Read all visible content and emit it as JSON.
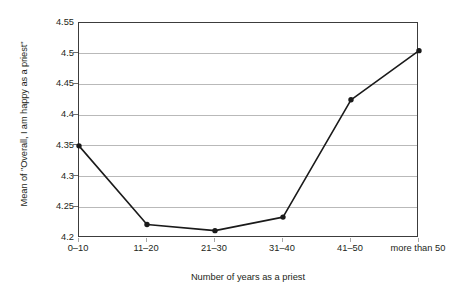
{
  "chart_data": {
    "type": "line",
    "title": "",
    "subtitle": "",
    "xlabel": "Number of years as a priest",
    "ylabel": "Mean of \"Overall, I am happy as a priest\"",
    "categories": [
      "0–10",
      "11–20",
      "21–30",
      "31–40",
      "41–50",
      "more than 50"
    ],
    "values": [
      4.35,
      4.222,
      4.212,
      4.234,
      4.425,
      4.505
    ],
    "series": [
      {
        "name": "Mean of \"Overall, I am happy as a priest\"",
        "values": [
          4.35,
          4.222,
          4.212,
          4.234,
          4.425,
          4.505
        ]
      }
    ],
    "ylim": [
      4.2,
      4.55
    ],
    "xlim": [
      0,
      5
    ],
    "ytick_labels": [
      "4.2",
      "4.25",
      "4.3",
      "4.35",
      "4.4",
      "4.45",
      "4.5",
      "4.55"
    ],
    "ytick_values": [
      4.2,
      4.25,
      4.3,
      4.35,
      4.4,
      4.45,
      4.5,
      4.55
    ],
    "grid": true,
    "grid_axis": "y",
    "legend": false,
    "legend_position": "none",
    "marker": "circle",
    "line_color": "#1a1a1a",
    "marker_color": "#1a1a1a",
    "grid_color": "#b9b9b9",
    "axis_color": "#3c3c3c",
    "background_color": "#ffffff",
    "annotations": []
  }
}
